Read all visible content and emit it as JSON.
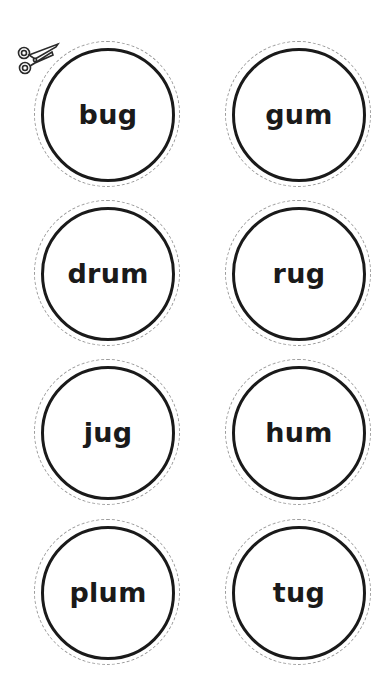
{
  "cards": [
    {
      "word": "bug",
      "cx": 106,
      "cy": 113
    },
    {
      "word": "gum",
      "cx": 297,
      "cy": 113
    },
    {
      "word": "drum",
      "cx": 106,
      "cy": 272
    },
    {
      "word": "rug",
      "cx": 297,
      "cy": 272
    },
    {
      "word": "jug",
      "cx": 106,
      "cy": 431
    },
    {
      "word": "hum",
      "cx": 297,
      "cy": 431
    },
    {
      "word": "plum",
      "cx": 106,
      "cy": 591
    },
    {
      "word": "tug",
      "cx": 297,
      "cy": 591
    }
  ],
  "icons": {
    "cut": "scissors-icon"
  }
}
